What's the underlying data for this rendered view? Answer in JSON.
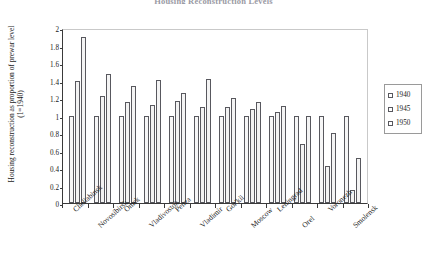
{
  "chart_data": {
    "type": "bar",
    "title": "Housing Reconstruction Levels",
    "xlabel": "",
    "ylabel": "Housing reconstruction as proportion of prewar level (1=1940)",
    "ylim": [
      0,
      2
    ],
    "ytick_labels": [
      "2",
      "1.8",
      "1.6",
      "1.4",
      "1.2",
      "1",
      "0.8",
      "0.6",
      "0.4",
      "0.2",
      "0"
    ],
    "ytick_values": [
      2,
      1.8,
      1.6,
      1.4,
      1.2,
      1,
      0.8,
      0.6,
      0.4,
      0.2,
      0
    ],
    "grid": false,
    "legend_position": "right",
    "categories": [
      "Cheliabinsk",
      "Novosibirsk",
      "Omsk",
      "Vladivostok",
      "Penza",
      "Vladimir",
      "Gor'kii",
      "Moscow",
      "Leningrad",
      "Orel",
      "Voronezh",
      "Smolensk"
    ],
    "series": [
      {
        "name": "1940",
        "values": [
          1.0,
          1.0,
          1.0,
          1.0,
          1.0,
          1.0,
          1.0,
          1.0,
          1.0,
          1.0,
          1.0,
          1.0
        ]
      },
      {
        "name": "1945",
        "values": [
          1.4,
          1.22,
          1.15,
          1.12,
          1.17,
          1.1,
          1.1,
          1.07,
          1.04,
          0.68,
          0.42,
          0.15
        ]
      },
      {
        "name": "1950",
        "values": [
          1.9,
          1.48,
          1.34,
          1.41,
          1.26,
          1.42,
          1.2,
          1.15,
          1.11,
          1.0,
          0.8,
          0.52
        ]
      }
    ]
  },
  "legend": {
    "entries": [
      "1940",
      "1945",
      "1950"
    ]
  },
  "colors": {
    "bar_fill": "#f2f2f2",
    "bar_stroke": "#58585e",
    "axis": "#3a3a3a",
    "text": "#1a1a1a"
  }
}
